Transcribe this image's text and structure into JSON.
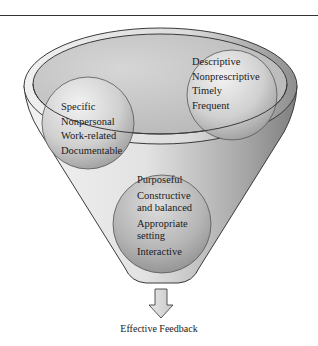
{
  "diagram": {
    "left_circle": {
      "items": [
        "Specific",
        "Nonpersonal",
        "Work-related",
        "Documentable"
      ]
    },
    "right_circle": {
      "items": [
        "Descriptive",
        "Nonprescriptive",
        "Timely",
        "Frequent"
      ]
    },
    "bottom_circle": {
      "items": [
        "Purposeful",
        "Constructive",
        "and balanced",
        "Appropriate",
        "setting",
        "Interactive"
      ]
    },
    "output_label": "Effective Feedback",
    "colors": {
      "funnel_light": "#e6e6e6",
      "funnel_dark": "#8c8c8c",
      "rim": "#d9d9d9",
      "sphere_light": "#e8e8e8",
      "sphere_dark": "#9a9a9a",
      "outline": "#3a3a3a"
    }
  }
}
